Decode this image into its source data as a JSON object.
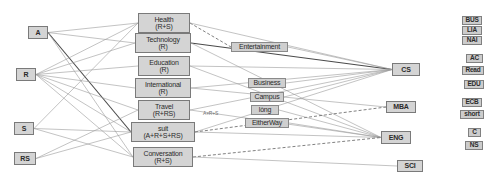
{
  "diagram": {
    "colors": {
      "node_fill": "#d4d4d4",
      "node_border": "#7a7a7a",
      "edge_light": "#9a9a9a",
      "edge_dark": "#4a4a4a",
      "background": "#ffffff"
    },
    "source_nodes": [
      {
        "id": "A",
        "label": "A",
        "x": 28,
        "y": 26,
        "w": 20,
        "h": 13
      },
      {
        "id": "R",
        "label": "R",
        "x": 16,
        "y": 68,
        "w": 20,
        "h": 13
      },
      {
        "id": "S",
        "label": "S",
        "x": 14,
        "y": 122,
        "w": 20,
        "h": 13
      },
      {
        "id": "RS",
        "label": "RS",
        "x": 14,
        "y": 152,
        "w": 22,
        "h": 13
      }
    ],
    "middle_nodes": [
      {
        "id": "health",
        "l1": "Health",
        "l2": "(R+S)",
        "x": 138,
        "y": 13,
        "w": 52,
        "h": 20
      },
      {
        "id": "technology",
        "l1": "Technology",
        "l2": "(R)",
        "x": 135,
        "y": 33,
        "w": 56,
        "h": 20
      },
      {
        "id": "education",
        "l1": "Education",
        "l2": "(R)",
        "x": 138,
        "y": 56,
        "w": 52,
        "h": 20
      },
      {
        "id": "international",
        "l1": "International",
        "l2": "(R)",
        "x": 135,
        "y": 78,
        "w": 56,
        "h": 20
      },
      {
        "id": "travel",
        "l1": "Travel",
        "l2": "(R+RS)",
        "x": 138,
        "y": 100,
        "w": 52,
        "h": 20
      },
      {
        "id": "suit",
        "l1": "suit",
        "l2": "(A+R+S+RS)",
        "x": 131,
        "y": 122,
        "w": 64,
        "h": 20
      },
      {
        "id": "conversation",
        "l1": "Conversation",
        "l2": "(R+S)",
        "x": 133,
        "y": 147,
        "w": 60,
        "h": 20
      }
    ],
    "middle_labels": [
      {
        "id": "entertainment",
        "label": "Entertainment",
        "x": 231,
        "y": 42,
        "w": 57,
        "h": 10
      },
      {
        "id": "business",
        "label": "Business",
        "x": 248,
        "y": 78,
        "w": 38,
        "h": 10
      },
      {
        "id": "campus",
        "label": "Campus",
        "x": 250,
        "y": 92,
        "w": 34,
        "h": 10
      },
      {
        "id": "long",
        "label": "lòng",
        "x": 251,
        "y": 105,
        "w": 28,
        "h": 10
      },
      {
        "id": "eitherway",
        "label": "EitherWay",
        "x": 245,
        "y": 118,
        "w": 44,
        "h": 10
      }
    ],
    "dest_nodes": [
      {
        "id": "CS",
        "label": "CS",
        "x": 392,
        "y": 63,
        "w": 28,
        "h": 13
      },
      {
        "id": "MBA",
        "label": "MBA",
        "x": 386,
        "y": 101,
        "w": 30,
        "h": 12
      },
      {
        "id": "ENG",
        "label": "ENG",
        "x": 381,
        "y": 131,
        "w": 30,
        "h": 13
      },
      {
        "id": "SCI",
        "label": "SCI",
        "x": 397,
        "y": 160,
        "w": 26,
        "h": 12
      }
    ],
    "legend_items": [
      {
        "id": "bus",
        "label": "BUS",
        "x": 462,
        "y": 16,
        "w": 20,
        "h": 9
      },
      {
        "id": "lia",
        "label": "LIA",
        "x": 462,
        "y": 26,
        "w": 20,
        "h": 9
      },
      {
        "id": "nai",
        "label": "NAI",
        "x": 462,
        "y": 36,
        "w": 20,
        "h": 9
      },
      {
        "id": "ac",
        "label": "AC",
        "x": 466,
        "y": 54,
        "w": 17,
        "h": 9
      },
      {
        "id": "read",
        "label": "Read",
        "x": 462,
        "y": 66,
        "w": 22,
        "h": 9
      },
      {
        "id": "edu",
        "label": "EDU",
        "x": 464,
        "y": 80,
        "w": 20,
        "h": 9
      },
      {
        "id": "ecb",
        "label": "ECB",
        "x": 462,
        "y": 98,
        "w": 20,
        "h": 9
      },
      {
        "id": "short",
        "label": "short",
        "x": 460,
        "y": 110,
        "w": 24,
        "h": 9
      },
      {
        "id": "c",
        "label": "C",
        "x": 468,
        "y": 128,
        "w": 13,
        "h": 9
      },
      {
        "id": "ns",
        "label": "NS",
        "x": 465,
        "y": 141,
        "w": 18,
        "h": 9
      }
    ],
    "annotations": [
      {
        "id": "suit-edge-note",
        "text": "A+R+S",
        "x": 203,
        "y": 110
      }
    ],
    "edges": [
      {
        "from": "A",
        "to": "health",
        "style": "light"
      },
      {
        "from": "A",
        "to": "technology",
        "style": "light"
      },
      {
        "from": "A",
        "to": "suit",
        "style": "dark"
      },
      {
        "from": "A",
        "to": "conversation",
        "style": "light"
      },
      {
        "from": "R",
        "to": "health",
        "style": "light"
      },
      {
        "from": "R",
        "to": "technology",
        "style": "light"
      },
      {
        "from": "R",
        "to": "education",
        "style": "light"
      },
      {
        "from": "R",
        "to": "international",
        "style": "light"
      },
      {
        "from": "R",
        "to": "travel",
        "style": "light"
      },
      {
        "from": "R",
        "to": "suit",
        "style": "light"
      },
      {
        "from": "R",
        "to": "conversation",
        "style": "light"
      },
      {
        "from": "S",
        "to": "health",
        "style": "light"
      },
      {
        "from": "S",
        "to": "suit",
        "style": "light"
      },
      {
        "from": "S",
        "to": "conversation",
        "style": "light"
      },
      {
        "from": "RS",
        "to": "travel",
        "style": "light"
      },
      {
        "from": "RS",
        "to": "suit",
        "style": "light"
      },
      {
        "from": "health",
        "to": "entertainment",
        "style": "dashed"
      },
      {
        "from": "health",
        "to": "CS",
        "style": "light"
      },
      {
        "from": "technology",
        "to": "CS",
        "style": "dark"
      },
      {
        "from": "technology",
        "to": "ENG",
        "style": "light"
      },
      {
        "from": "education",
        "to": "CS",
        "style": "light"
      },
      {
        "from": "education",
        "to": "ENG",
        "style": "light"
      },
      {
        "from": "international",
        "to": "CS",
        "style": "light"
      },
      {
        "from": "international",
        "to": "MBA",
        "style": "light"
      },
      {
        "from": "travel",
        "to": "CS",
        "style": "light"
      },
      {
        "from": "travel",
        "to": "ENG",
        "style": "light"
      },
      {
        "from": "suit",
        "to": "CS",
        "style": "light"
      },
      {
        "from": "suit",
        "to": "MBA",
        "style": "dashed"
      },
      {
        "from": "suit",
        "to": "ENG",
        "style": "light"
      },
      {
        "from": "conversation",
        "to": "ENG",
        "style": "dashed"
      },
      {
        "from": "conversation",
        "to": "SCI",
        "style": "light"
      },
      {
        "from": "entertainment",
        "to": "CS",
        "style": "light"
      },
      {
        "from": "business",
        "to": "CS",
        "style": "light"
      },
      {
        "from": "campus",
        "to": "CS",
        "style": "light"
      },
      {
        "from": "long",
        "to": "ENG",
        "style": "light"
      },
      {
        "from": "eitherway",
        "to": "ENG",
        "style": "light"
      }
    ]
  }
}
